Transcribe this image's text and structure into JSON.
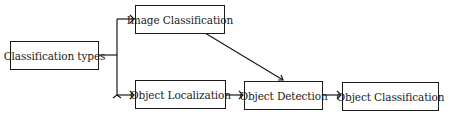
{
  "diagram": {
    "nodes": [
      {
        "id": "root",
        "label": "Classification types"
      },
      {
        "id": "image_classification",
        "label": "Image Classification"
      },
      {
        "id": "object_localization",
        "label": "Object Localization"
      },
      {
        "id": "object_detection",
        "label": "Object Detection"
      },
      {
        "id": "object_classification",
        "label": "Object Classification"
      }
    ],
    "edges": [
      {
        "from": "root",
        "to": "image_classification"
      },
      {
        "from": "root",
        "to": "object_localization"
      },
      {
        "from": "image_classification",
        "to": "object_detection"
      },
      {
        "from": "object_localization",
        "to": "object_detection"
      },
      {
        "from": "object_detection",
        "to": "object_classification"
      }
    ],
    "line_color": "#1a1a1a"
  }
}
